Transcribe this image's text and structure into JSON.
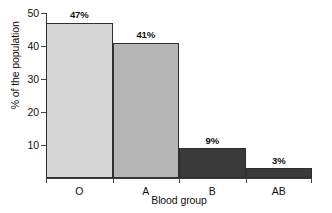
{
  "chart_data": {
    "type": "bar",
    "title": "",
    "subtitle": "",
    "categories": [
      "O",
      "A",
      "B",
      "AB"
    ],
    "values": [
      47,
      41,
      9,
      3
    ],
    "data_labels": [
      "47%",
      "41%",
      "9%",
      "3%"
    ],
    "xlabel": "Blood group",
    "ylabel": "% of the population",
    "ylim": [
      0,
      50
    ],
    "yticks": [
      10,
      20,
      30,
      40,
      50
    ],
    "ytick_labels": [
      "10",
      "20",
      "30",
      "40",
      "50"
    ],
    "grid": false,
    "legend": false,
    "legend_position": "none",
    "bar_gap": 0,
    "series": [
      {
        "name": "% of the population",
        "values": [
          47,
          41,
          9,
          3
        ]
      }
    ],
    "bar_colors": [
      "#d6d6d6",
      "#b6b6b6",
      "#3a3a3a",
      "#3a3a3a"
    ],
    "bar_border_color": "#2f2f2f",
    "axis_color": "#3c3c3c",
    "text_color": "#111111",
    "background_color": "#ffffff"
  },
  "axes": {
    "y_title": "% of the population",
    "x_title": "Blood group",
    "y_ticks": [
      {
        "label": "50",
        "value": 50
      },
      {
        "label": "40",
        "value": 40
      },
      {
        "label": "30",
        "value": 30
      },
      {
        "label": "20",
        "value": 20
      },
      {
        "label": "10",
        "value": 10
      }
    ],
    "x_categories": [
      {
        "label": "O"
      },
      {
        "label": "A"
      },
      {
        "label": "B"
      },
      {
        "label": "AB"
      }
    ]
  },
  "bars": [
    {
      "category": "O",
      "value": 47,
      "label": "47%",
      "color": "#d6d6d6"
    },
    {
      "category": "A",
      "value": 41,
      "label": "41%",
      "color": "#b6b6b6"
    },
    {
      "category": "B",
      "value": 9,
      "label": "9%",
      "color": "#3a3a3a"
    },
    {
      "category": "AB",
      "value": 3,
      "label": "3%",
      "color": "#3a3a3a"
    }
  ]
}
